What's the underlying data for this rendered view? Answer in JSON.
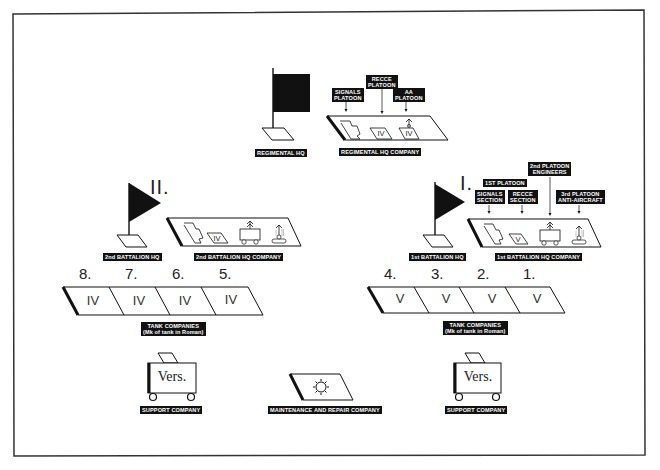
{
  "regiment": {
    "hq_label": "REGIMENTAL HQ",
    "hq_company": {
      "label": "REGIMENTAL HQ COMPANY",
      "platoons": [
        {
          "label_line1": "SIGNALS",
          "label_line2": "PLATOON"
        },
        {
          "label_line1": "RECCE",
          "label_line2": "PLATOON"
        },
        {
          "label_line1": "AA",
          "label_line2": "PLATOON"
        }
      ],
      "tank_marks": [
        "IV",
        "IV"
      ]
    }
  },
  "battalions": [
    {
      "numeral": "II.",
      "hq_label": "2nd BATTALION HQ",
      "hq_company_label": "2nd BATTALION HQ COMPANY",
      "tank_mark": "IV",
      "tank_companies": {
        "numbers": [
          "8.",
          "7.",
          "6.",
          "5."
        ],
        "marks": [
          "IV",
          "IV",
          "IV",
          "IV"
        ],
        "label_line1": "TANK COMPANIES",
        "label_line2": "(Mk of tank in Roman)"
      },
      "support_company": {
        "vehicle_text": "Vers.",
        "label": "SUPPORT COMPANY"
      }
    },
    {
      "numeral": "I.",
      "hq_label": "1st BATTALION HQ",
      "hq_company_label": "1st BATTALION HQ COMPANY",
      "tank_mark": "V",
      "sub_units": [
        {
          "label_line1": "1ST PLATOON",
          "label_line2": ""
        },
        {
          "label_line1": "SIGNALS",
          "label_line2": "SECTION"
        },
        {
          "label_line1": "RECCE",
          "label_line2": "SECTION"
        },
        {
          "label_line1": "2nd PLATOON",
          "label_line2": "ENGINEERS"
        },
        {
          "label_line1": "3rd PLATOON",
          "label_line2": "ANTI-AIRCRAFT"
        }
      ],
      "tank_companies": {
        "numbers": [
          "4.",
          "3.",
          "2.",
          "1."
        ],
        "marks": [
          "V",
          "V",
          "V",
          "V"
        ],
        "label_line1": "TANK COMPANIES",
        "label_line2": "(Mk of tank in Roman)"
      },
      "support_company": {
        "vehicle_text": "Vers.",
        "label": "SUPPORT COMPANY"
      }
    }
  ],
  "maintenance": {
    "label": "MAINTENANCE AND REPAIR COMPANY",
    "icon": "sun-gear-icon"
  },
  "colors": {
    "ink": "#111111",
    "paper": "#ffffff"
  }
}
